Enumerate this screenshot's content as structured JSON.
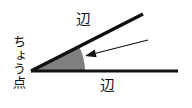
{
  "diagram": {
    "type": "geometry-angle-figure",
    "labels": {
      "side_top": "辺",
      "side_bottom": "辺",
      "vertex": "ちょう点"
    },
    "colors": {
      "background": "#ffffff",
      "stroke": "#111111",
      "wedge_fill": "#808080",
      "arrow": "#111111",
      "text": "#111111"
    },
    "geometry": {
      "vertex": {
        "x": 31,
        "y": 71
      },
      "ray_horizontal_end": {
        "x": 178,
        "y": 71
      },
      "ray_upper_end": {
        "x": 143,
        "y": 14
      },
      "angle_degrees": 21,
      "wedge_radius": 54,
      "ray_stroke_width": 3.5,
      "baseline_stroke_width": 3
    },
    "arrow": {
      "tail": {
        "x": 148,
        "y": 40
      },
      "tip": {
        "x": 85,
        "y": 56
      },
      "stroke_width": 1.2,
      "head_length": 11,
      "head_width": 8
    }
  }
}
